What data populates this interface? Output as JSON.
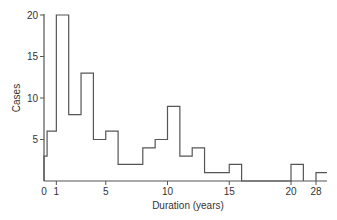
{
  "chart_data": {
    "type": "bar",
    "subtype": "histogram-step",
    "title": "",
    "xlabel": "Duration (years)",
    "ylabel": "Cases",
    "ylim": [
      0,
      20
    ],
    "yticks": [
      5,
      10,
      15,
      20
    ],
    "xticks": [
      "0",
      "1",
      "5",
      "10",
      "15",
      "20",
      "28"
    ],
    "grid": false,
    "legend": null,
    "bins": [
      {
        "start": 0,
        "end": 0.25,
        "count": 3
      },
      {
        "start": 0.25,
        "end": 1,
        "count": 6
      },
      {
        "start": 1,
        "end": 2,
        "count": 20
      },
      {
        "start": 2,
        "end": 3,
        "count": 8
      },
      {
        "start": 3,
        "end": 4,
        "count": 13
      },
      {
        "start": 4,
        "end": 5,
        "count": 5
      },
      {
        "start": 5,
        "end": 6,
        "count": 6
      },
      {
        "start": 6,
        "end": 8,
        "count": 2
      },
      {
        "start": 8,
        "end": 9,
        "count": 4
      },
      {
        "start": 9,
        "end": 10,
        "count": 5
      },
      {
        "start": 10,
        "end": 11,
        "count": 9
      },
      {
        "start": 11,
        "end": 12,
        "count": 3
      },
      {
        "start": 12,
        "end": 13,
        "count": 4
      },
      {
        "start": 13,
        "end": 15,
        "count": 1
      },
      {
        "start": 15,
        "end": 16,
        "count": 2
      },
      {
        "start": 16,
        "end": 20,
        "count": 0
      },
      {
        "start": 20,
        "end": 21,
        "count": 2
      },
      {
        "start": 28,
        "end": 29,
        "count": 1
      }
    ],
    "colors": {
      "line": "#555555",
      "text": "#333333",
      "background": "#ffffff"
    }
  }
}
